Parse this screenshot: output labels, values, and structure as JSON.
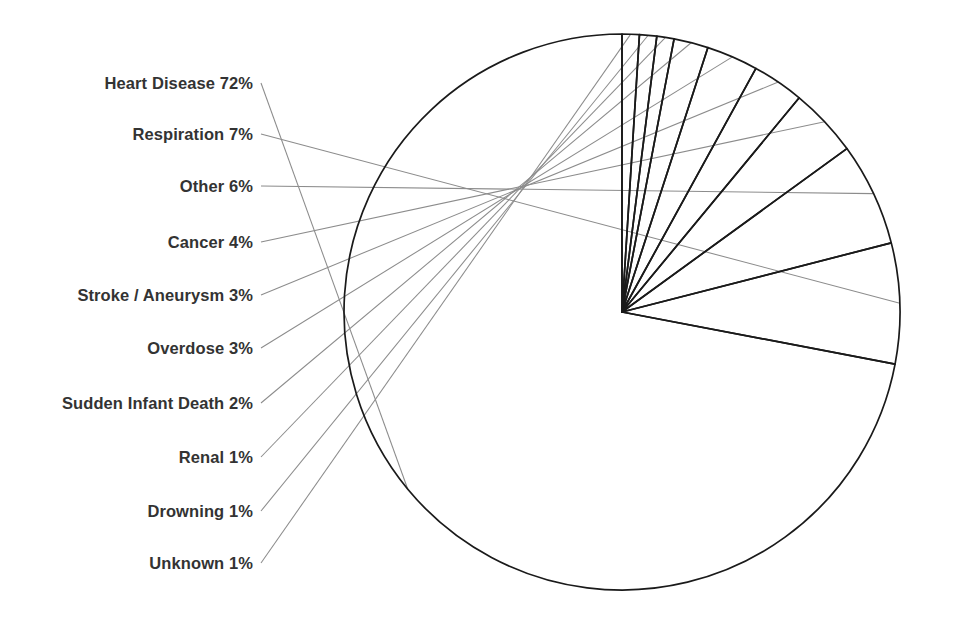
{
  "chart_data": {
    "type": "pie",
    "title": "",
    "subtitle": "",
    "xlabel": "",
    "ylabel": "",
    "legend_position": "none",
    "grid": false,
    "units": "percent",
    "total": 100,
    "start_angle_deg": 90,
    "direction": "counterclockwise",
    "categories": [
      "Heart Disease",
      "Respiration",
      "Other",
      "Cancer",
      "Stroke / Aneurysm",
      "Overdose",
      "Sudden Infant Death",
      "Renal",
      "Drowning",
      "Unknown"
    ],
    "values": [
      72,
      7,
      6,
      4,
      3,
      3,
      2,
      1,
      1,
      1
    ],
    "slices": [
      {
        "label": "Heart Disease",
        "value": 72,
        "label_text": "Heart Disease 72%",
        "label_y": 83
      },
      {
        "label": "Respiration",
        "value": 7,
        "label_text": "Respiration 7%",
        "label_y": 134
      },
      {
        "label": "Other",
        "value": 6,
        "label_text": "Other 6%",
        "label_y": 186
      },
      {
        "label": "Cancer",
        "value": 4,
        "label_text": "Cancer 4%",
        "label_y": 242
      },
      {
        "label": "Stroke / Aneurysm",
        "value": 3,
        "label_text": "Stroke / Aneurysm 3%",
        "label_y": 295
      },
      {
        "label": "Overdose",
        "value": 3,
        "label_text": "Overdose 3%",
        "label_y": 348
      },
      {
        "label": "Sudden Infant Death",
        "value": 2,
        "label_text": "Sudden Infant Death 2%",
        "label_y": 403
      },
      {
        "label": "Renal",
        "value": 1,
        "label_text": "Renal 1%",
        "label_y": 457
      },
      {
        "label": "Drowning",
        "value": 1,
        "label_text": "Drowning 1%",
        "label_y": 511
      },
      {
        "label": "Unknown",
        "value": 1,
        "label_text": "Unknown 1%",
        "label_y": 563
      }
    ],
    "style": {
      "background": "#ffffff",
      "slice_fill": "none",
      "slice_stroke": "#1a1a1a",
      "leader_stroke": "#8c8c8c",
      "label_color": "#333333"
    },
    "geometry": {
      "center_x": 622,
      "center_y": 312,
      "radius": 278,
      "label_right_edge": 253,
      "leader_start_gap": 8
    }
  }
}
